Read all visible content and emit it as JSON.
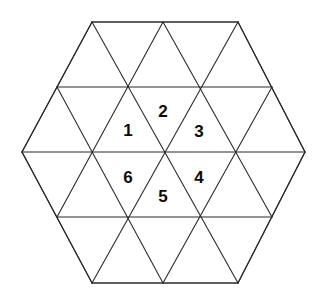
{
  "figure": {
    "name": "hexagon-triangle-tiling",
    "background_color": "#ffffff",
    "line_color": "#2b2b2b",
    "fill_color": "#ffffff",
    "label_color": "#0a0a0a",
    "line_width": 1.1
  },
  "hexagon": {
    "center": {
      "x": 163,
      "y": 152
    },
    "vertices": [
      {
        "x": 92,
        "y": 22
      },
      {
        "x": 238,
        "y": 22
      },
      {
        "x": 305,
        "y": 152
      },
      {
        "x": 238,
        "y": 283
      },
      {
        "x": 92,
        "y": 283
      },
      {
        "x": 22,
        "y": 152
      }
    ],
    "triangle_side": 73,
    "row_height": 65,
    "total_triangles": 24,
    "rows": 4
  },
  "grid": {
    "horizontal_lines": [
      {
        "y": 22,
        "x1": 92,
        "x2": 238
      },
      {
        "y": 87,
        "x1": 57,
        "x2": 272
      },
      {
        "y": 152,
        "x1": 22,
        "x2": 305
      },
      {
        "y": 217,
        "x1": 57,
        "x2": 272
      },
      {
        "y": 283,
        "x1": 92,
        "x2": 238
      }
    ],
    "diagonal_down_right": [
      {
        "x1": 22,
        "y1": 152,
        "x2": 92,
        "y2": 283
      },
      {
        "x1": 57,
        "y1": 87,
        "x2": 163,
        "y2": 283
      },
      {
        "x1": 92,
        "y1": 22,
        "x2": 238,
        "y2": 283
      },
      {
        "x1": 163,
        "y1": 22,
        "x2": 272,
        "y2": 217
      },
      {
        "x1": 238,
        "y1": 22,
        "x2": 305,
        "y2": 152
      }
    ],
    "diagonal_up_right": [
      {
        "x1": 22,
        "y1": 152,
        "x2": 92,
        "y2": 22
      },
      {
        "x1": 57,
        "y1": 217,
        "x2": 163,
        "y2": 22
      },
      {
        "x1": 92,
        "y1": 283,
        "x2": 238,
        "y2": 22
      },
      {
        "x1": 163,
        "y1": 283,
        "x2": 272,
        "y2": 87
      },
      {
        "x1": 238,
        "y1": 283,
        "x2": 305,
        "y2": 152
      }
    ]
  },
  "labels": [
    {
      "id": "label-1",
      "text": "1",
      "x": 128,
      "y": 130,
      "orientation": "up",
      "cell": "upper-left"
    },
    {
      "id": "label-2",
      "text": "2",
      "x": 163,
      "y": 111,
      "orientation": "down",
      "cell": "upper-middle"
    },
    {
      "id": "label-3",
      "text": "3",
      "x": 199,
      "y": 131,
      "orientation": "up",
      "cell": "upper-right"
    },
    {
      "id": "label-4",
      "text": "4",
      "x": 199,
      "y": 177,
      "orientation": "down",
      "cell": "lower-right"
    },
    {
      "id": "label-5",
      "text": "5",
      "x": 163,
      "y": 196,
      "orientation": "up",
      "cell": "lower-middle"
    },
    {
      "id": "label-6",
      "text": "6",
      "x": 128,
      "y": 177,
      "orientation": "down",
      "cell": "lower-left"
    }
  ],
  "chart_data": {
    "type": "diagram",
    "title": "",
    "shape": "regular-hexagon",
    "tiling": "equilateral-triangles",
    "numbered_cells": [
      "1",
      "2",
      "3",
      "4",
      "5",
      "6"
    ],
    "numbered_cell_count": 6,
    "unnumbered_cell_count": 18,
    "total_cells": 24
  }
}
